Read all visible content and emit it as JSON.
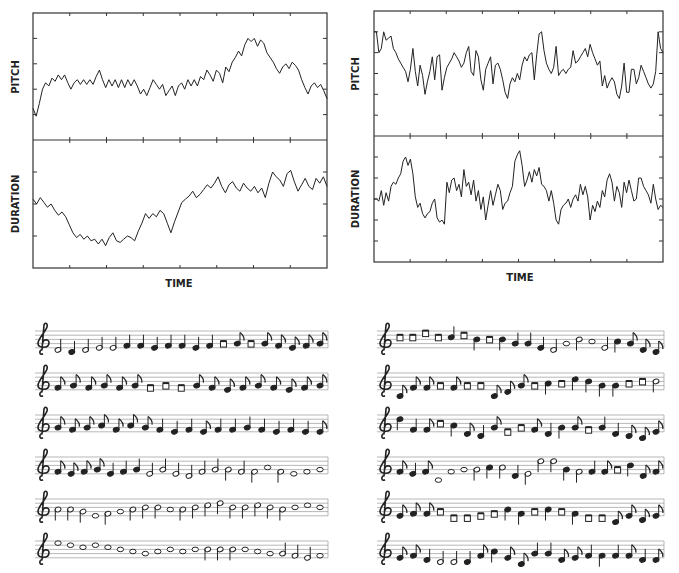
{
  "chart_data": [
    {
      "type": "line",
      "title": "",
      "panel": "left",
      "xlabel": "TIME",
      "subplots": [
        {
          "ylabel": "PITCH",
          "ylim": [
            0,
            8
          ],
          "yticks": 4,
          "xticks": 8,
          "values": [
            2.0,
            1.5,
            2.3,
            3.2,
            3.6,
            3.4,
            3.9,
            3.7,
            4.1,
            3.8,
            4.1,
            3.6,
            3.2,
            3.6,
            3.8,
            3.5,
            3.8,
            3.5,
            3.8,
            3.5,
            4.0,
            4.4,
            3.8,
            3.3,
            3.8,
            3.4,
            3.8,
            3.3,
            3.8,
            3.3,
            3.8,
            3.4,
            3.8,
            3.4,
            2.9,
            3.2,
            2.8,
            3.3,
            3.8,
            3.5,
            3.2,
            3.5,
            2.8,
            3.1,
            3.4,
            2.8,
            3.4,
            3.6,
            3.2,
            3.8,
            3.4,
            3.8,
            3.4,
            4.0,
            3.8,
            4.4,
            4.1,
            3.7,
            4.4,
            4.2,
            3.6,
            4.6,
            4.3,
            4.9,
            5.2,
            5.6,
            5.3,
            6.0,
            6.4,
            6.2,
            6.4,
            5.9,
            6.3,
            6.1,
            5.5,
            5.2,
            4.9,
            4.5,
            4.2,
            4.6,
            4.8,
            4.5,
            4.9,
            4.7,
            4.4,
            3.8,
            3.3,
            2.9,
            3.4,
            3.6,
            3.3,
            3.5,
            3.1,
            2.6
          ]
        },
        {
          "ylabel": "DURATION",
          "ylim": [
            0,
            8
          ],
          "yticks": 3,
          "values": [
            4.3,
            4.0,
            4.4,
            4.1,
            3.8,
            4.0,
            3.6,
            3.3,
            3.5,
            3.2,
            2.7,
            2.2,
            1.9,
            2.1,
            1.8,
            2.0,
            1.7,
            1.8,
            1.5,
            1.8,
            1.4,
            1.9,
            2.2,
            1.7,
            1.6,
            1.8,
            2.0,
            1.9,
            1.7,
            2.3,
            2.8,
            3.4,
            3.1,
            3.4,
            3.2,
            3.6,
            3.4,
            2.8,
            2.2,
            2.9,
            3.5,
            4.1,
            4.3,
            4.5,
            4.8,
            4.4,
            4.6,
            4.9,
            5.2,
            5.0,
            5.3,
            5.7,
            5.1,
            4.7,
            5.2,
            5.4,
            5.0,
            4.8,
            5.3,
            5.0,
            4.8,
            5.1,
            4.7,
            5.0,
            4.4,
            5.3,
            6.0,
            5.7,
            5.5,
            5.1,
            5.9,
            6.1,
            5.4,
            4.8,
            5.2,
            5.6,
            5.1,
            4.9,
            5.6,
            5.3,
            5.7,
            5.1
          ]
        }
      ]
    },
    {
      "type": "line",
      "title": "",
      "panel": "right",
      "xlabel": "TIME",
      "subplots": [
        {
          "ylabel": "PITCH",
          "ylim": [
            0,
            6
          ],
          "yticks": 5,
          "xticks": 8,
          "values": [
            5.0,
            5.0,
            4.0,
            4.2,
            5.0,
            4.6,
            4.7,
            4.8,
            4.2,
            4.0,
            3.7,
            3.5,
            3.3,
            3.1,
            2.6,
            3.2,
            4.2,
            3.1,
            2.4,
            3.4,
            2.9,
            2.0,
            2.6,
            3.1,
            3.8,
            2.7,
            3.8,
            3.9,
            2.2,
            2.8,
            3.3,
            3.5,
            3.7,
            4.0,
            3.8,
            3.6,
            3.3,
            3.5,
            4.0,
            4.3,
            3.1,
            2.9,
            4.1,
            3.8,
            2.7,
            2.2,
            3.2,
            3.5,
            3.8,
            2.5,
            3.4,
            3.5,
            3.2,
            2.7,
            2.1,
            1.8,
            2.5,
            2.8,
            2.6,
            3.0,
            2.7,
            3.4,
            3.8,
            3.6,
            3.9,
            4.0,
            2.7,
            3.9,
            4.9,
            5.0,
            4.1,
            3.5,
            3.2,
            3.0,
            3.3,
            4.3,
            2.9,
            3.1,
            3.2,
            3.0,
            3.2,
            3.3,
            4.1,
            3.5,
            3.6,
            3.8,
            4.0,
            4.2,
            3.8,
            4.4,
            4.0,
            3.7,
            3.4,
            3.6,
            2.4,
            2.9,
            2.3,
            2.6,
            2.8,
            2.6,
            2.0,
            1.8,
            2.4,
            3.5,
            2.1,
            2.1,
            3.2,
            3.2,
            2.5,
            2.8,
            3.4,
            3.1,
            2.8,
            2.5,
            2.3,
            2.5,
            3.1,
            5.0,
            4.2,
            4.0
          ]
        },
        {
          "ylabel": "DURATION",
          "ylim": [
            0,
            6
          ],
          "yticks": 5,
          "values": [
            3.0,
            3.0,
            2.9,
            3.4,
            2.7,
            3.3,
            2.9,
            3.6,
            3.8,
            3.7,
            4.0,
            4.2,
            4.8,
            5.0,
            4.6,
            4.9,
            4.2,
            3.1,
            2.6,
            2.8,
            2.3,
            2.1,
            2.3,
            2.4,
            2.8,
            3.0,
            2.1,
            1.9,
            2.0,
            1.8,
            3.8,
            3.3,
            3.9,
            4.0,
            3.4,
            3.7,
            3.1,
            4.4,
            3.6,
            3.8,
            3.2,
            3.9,
            2.9,
            3.4,
            2.5,
            3.1,
            2.0,
            2.7,
            3.4,
            2.7,
            3.2,
            3.7,
            3.4,
            2.5,
            2.8,
            2.9,
            3.3,
            3.6,
            4.8,
            5.1,
            5.3,
            4.6,
            3.6,
            3.9,
            4.3,
            3.8,
            4.4,
            4.1,
            4.5,
            3.7,
            3.6,
            3.4,
            2.9,
            3.4,
            2.8,
            2.0,
            1.8,
            2.5,
            2.7,
            2.8,
            3.0,
            2.6,
            3.0,
            3.2,
            2.9,
            3.7,
            3.2,
            3.6,
            3.1,
            2.0,
            2.7,
            2.4,
            2.9,
            2.6,
            3.4,
            3.1,
            3.9,
            4.2,
            3.8,
            2.9,
            3.6,
            3.3,
            2.6,
            3.8,
            3.3,
            3.9,
            3.4,
            2.9,
            3.0,
            4.0,
            4.0,
            3.6,
            3.4,
            3.2,
            2.8,
            3.7,
            3.0,
            2.5,
            2.7,
            2.6
          ]
        }
      ]
    }
  ],
  "notation": {
    "clef": "treble",
    "left_staves": [
      [
        "h:-1",
        "q:-2",
        "h:-1",
        "h:0",
        "h:0",
        "q:1",
        "q:1",
        "q:0",
        "q:1",
        "q:1",
        "q:0",
        "q:1",
        "e2:2",
        "e:2",
        "e2:2",
        "e:2",
        "e:1",
        "e:0",
        "e:1",
        "e:2"
      ],
      [
        "e:1",
        "e:2",
        "e:1",
        "e:2",
        "e:1",
        "e:2",
        "e2:1",
        "e2:2",
        "e2:1",
        "e:2",
        "e:1",
        "e:0",
        "e:1",
        "e:2",
        "e:1",
        "e:0",
        "e:1",
        "e:2"
      ],
      [
        "e:2",
        "e:1",
        "e:2",
        "e:3",
        "e:1",
        "e:3",
        "e:2",
        "q:1",
        "q:0",
        "q:1",
        "e:0",
        "q:1",
        "q:1",
        "q:2",
        "q:1",
        "q:0",
        "q:1",
        "q:0",
        "e:0"
      ],
      [
        "e:1",
        "e:0",
        "e:1",
        "e:2",
        "q:0",
        "q:1",
        "q:2",
        "h:0",
        "h:2",
        "h:0",
        "h:-1",
        "h:1",
        "h:2",
        "hu:2",
        "h:1",
        "hu:1",
        "w:3",
        "hu:1",
        "w:0",
        "w:1",
        "w:2"
      ],
      [
        "hu:3",
        "hu:3",
        "hu:2",
        "w:0",
        "hu:1",
        "w:2",
        "hu:3",
        "hu:4",
        "hu:4",
        "w:3",
        "hu:3",
        "hu:4",
        "hu:5",
        "hu:6",
        "hu:4",
        "hu:4",
        "hu:5",
        "hu:4",
        "hu:3",
        "w:4",
        "w:5",
        "w:4"
      ],
      [
        "w:7",
        "w:6",
        "w:5",
        "w:6",
        "w:5",
        "w:4",
        "w:3",
        "w:2",
        "w:3",
        "w:4",
        "w:3",
        "w:4",
        "hu:4",
        "hu:4",
        "hu:4",
        "w:4",
        "w:3",
        "w:2",
        "h:2",
        "h:1",
        "h:0",
        "w:1"
      ]
    ],
    "right_staves": [
      [
        "e2:5",
        "e2:5",
        "e2:7",
        "e2:5",
        "q:5",
        "e2:6",
        "qu:4",
        "e2:4",
        "qu:4",
        "q:2",
        "q:2",
        "q:0",
        "h:-1",
        "w:2",
        "hu:4",
        "w:3",
        "h:0",
        "qu:3",
        "e:2",
        "e:-1",
        "e:-2"
      ],
      [
        "e:-3",
        "e:1",
        "e:1",
        "e2:2",
        "e:1",
        "e2:2",
        "e2:2",
        "e:-3",
        "e:-1",
        "e:2",
        "e2:2",
        "qu:3",
        "e2:3",
        "qu:5",
        "qu:4",
        "qu:2",
        "qu:2",
        "e2:3",
        "e2:4",
        "hu:4"
      ],
      [
        "qu:6",
        "q:1",
        "e:1",
        "e2:4",
        "qu:3",
        "e:-1",
        "q:-2",
        "e:2",
        "e2:0",
        "e2:2",
        "e:1",
        "q:-1",
        "qu:2",
        "e:2",
        "e2:1",
        "q:2",
        "q:-1",
        "e:-2",
        "e:-3",
        "e:0"
      ],
      [
        "e:1",
        "q:0",
        "e:1",
        "w:-3",
        "w:1",
        "w:2",
        "hu:2",
        "qu:3",
        "hu:3",
        "q:-1",
        "hu:0",
        "hu:6",
        "hu:6",
        "qu:2",
        "hu:1",
        "q:1",
        "e:1",
        "e2:2",
        "qu:4",
        "e:-1",
        "e:1"
      ],
      [
        "e:0",
        "e:1",
        "e:1",
        "e2:2",
        "e2:-1",
        "e2:-1",
        "e2:0",
        "e2:1",
        "qu:3",
        "qu:1",
        "e2:2",
        "qu:3",
        "e2:2",
        "qu:1",
        "e2:-1",
        "e2:-1",
        "e:-3",
        "e:0",
        "e:-2",
        "e:0"
      ],
      [
        "e:0",
        "e:1",
        "q:-1",
        "h:-2",
        "h:-2",
        "q:-2",
        "e:1",
        "qu:3",
        "e:0",
        "e:-3",
        "q:2",
        "q:2",
        "e:-1",
        "e:0",
        "q:1",
        "qu:1",
        "q:1",
        "e:1",
        "q:-1",
        "e:-1"
      ]
    ]
  }
}
